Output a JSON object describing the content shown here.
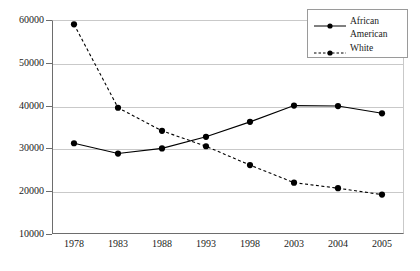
{
  "chart_data": {
    "type": "line",
    "title": "",
    "xlabel": "",
    "ylabel": "",
    "categories": [
      "1978",
      "1983",
      "1988",
      "1993",
      "1998",
      "2003",
      "2004",
      "2005"
    ],
    "ylim": [
      10000,
      60000
    ],
    "yticks": [
      10000,
      20000,
      30000,
      40000,
      50000,
      60000
    ],
    "ytick_labels": [
      "10000",
      "20000",
      "30000",
      "40000",
      "50000",
      "60000"
    ],
    "grid": true,
    "legend_position": "top-right",
    "series": [
      {
        "name": "African American",
        "line_style": "solid",
        "marker": "circle",
        "color": "#000000",
        "values": [
          31200,
          28800,
          30000,
          32700,
          36200,
          40000,
          39900,
          38200
        ]
      },
      {
        "name": "White",
        "line_style": "dashed",
        "marker": "circle",
        "color": "#000000",
        "values": [
          59000,
          39500,
          34100,
          30500,
          26100,
          22000,
          20700,
          19200
        ]
      }
    ]
  },
  "legend": {
    "entries": [
      {
        "label": "African",
        "label_continued": "American"
      },
      {
        "label": "White",
        "label_continued": ""
      }
    ]
  }
}
